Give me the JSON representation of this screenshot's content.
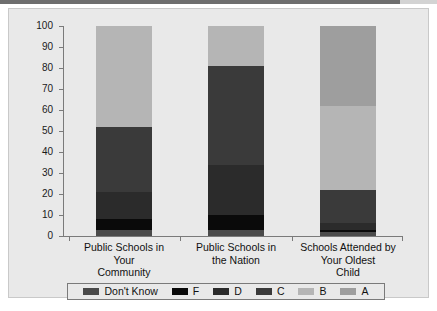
{
  "chart_data": {
    "type": "bar",
    "subtype": "stacked-bar-100",
    "title": "",
    "xlabel": "",
    "ylabel": "",
    "ylim": [
      0,
      100
    ],
    "yticks": [
      0,
      10,
      20,
      30,
      40,
      50,
      60,
      70,
      80,
      90,
      100
    ],
    "ytick_labels": [
      "0",
      "10",
      "20",
      "30",
      "40",
      "50",
      "60",
      "70",
      "80",
      "90",
      "100"
    ],
    "grid": false,
    "legend_position": "bottom",
    "categories": [
      "Public Schools in Your Community",
      "Public Schools in the Nation",
      "Schools Attended by Your Oldest Child"
    ],
    "category_lines": [
      [
        "Public Schools in",
        "Your",
        "Community"
      ],
      [
        "Public Schools in",
        "the Nation"
      ],
      [
        "Schools Attended by",
        "Your Oldest",
        "Child"
      ]
    ],
    "series": [
      {
        "name": "Don't Know",
        "color": "#4a4a4a",
        "values": [
          3,
          3,
          2
        ]
      },
      {
        "name": "F",
        "color": "#0a0a0a",
        "values": [
          5,
          7,
          1
        ]
      },
      {
        "name": "D",
        "color": "#2b2b2b",
        "values": [
          13,
          24,
          3
        ]
      },
      {
        "name": "C",
        "color": "#3a3a3a",
        "values": [
          31,
          47,
          16
        ]
      },
      {
        "name": "B",
        "color": "#b5b5b5",
        "values": [
          48,
          19,
          40
        ]
      },
      {
        "name": "A",
        "color": "#9e9e9e",
        "values": [
          0,
          0,
          38
        ]
      }
    ],
    "stack_tops": [
      [
        3,
        8,
        21,
        52,
        100,
        100
      ],
      [
        3,
        10,
        34,
        81,
        100,
        100
      ],
      [
        2,
        3,
        6,
        22,
        62,
        100
      ]
    ]
  },
  "legend": {
    "items": [
      {
        "label": "Don't Know",
        "color": "#4a4a4a"
      },
      {
        "label": "F",
        "color": "#0a0a0a"
      },
      {
        "label": "D",
        "color": "#2b2b2b"
      },
      {
        "label": "C",
        "color": "#3a3a3a"
      },
      {
        "label": "B",
        "color": "#b5b5b5"
      },
      {
        "label": "A",
        "color": "#9e9e9e"
      }
    ]
  },
  "colors": {
    "panel_background": "#e9e9e9",
    "page_background": "#ffffff",
    "axis": "#7a7a7a",
    "text": "#111111"
  }
}
